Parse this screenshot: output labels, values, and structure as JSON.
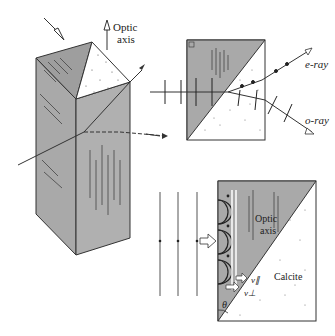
{
  "diagram": {
    "type": "birefringence-calcite",
    "panels": [
      {
        "id": "prism-3d",
        "labels": {
          "optic_axis": [
            "Optic",
            "axis"
          ]
        }
      },
      {
        "id": "glan-prism-section",
        "labels": {
          "e_ray": "e-ray",
          "o_ray": "o-ray"
        }
      },
      {
        "id": "huygens-wavelets",
        "labels": {
          "optic_axis": [
            "Optic",
            "axis"
          ],
          "material": "Calcite",
          "v_parallel": "v∥",
          "v_perp": "v⊥",
          "angle": "θ"
        }
      }
    ],
    "colors": {
      "crystal_fill": "#a8a8a8",
      "line": "#333333",
      "background": "#ffffff",
      "dotted_fill": "#ffffff"
    }
  }
}
